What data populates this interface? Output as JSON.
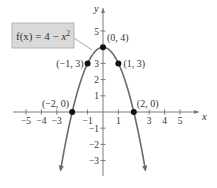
{
  "chart_data": {
    "type": "line",
    "title": "",
    "function_label": "f(x) = 4 − x²",
    "xlabel": "x",
    "ylabel": "y",
    "xlim": [
      -5.5,
      5.8
    ],
    "ylim": [
      -4.3,
      5.8
    ],
    "x_ticks": [
      -5,
      -4,
      -3,
      -1,
      1,
      3,
      4,
      5
    ],
    "x_tick_labels": [
      "−5",
      "−4",
      "−3",
      "−1",
      "1",
      "3",
      "4",
      "5"
    ],
    "y_ticks": [
      5,
      3,
      2,
      1,
      -1,
      -2,
      -3
    ],
    "y_tick_labels": [
      "5",
      "3",
      "2",
      "1",
      "−1",
      "−2",
      "−3"
    ],
    "grid": false,
    "series": [
      {
        "name": "f(x) = 4 − x²",
        "color": "#6b6b6b",
        "x_range": [
          -2.75,
          2.75
        ],
        "end_arrows": true
      }
    ],
    "points": [
      {
        "x": -2,
        "y": 0,
        "label": "(−2, 0)"
      },
      {
        "x": -1,
        "y": 3,
        "label": "(−1, 3)"
      },
      {
        "x": 0,
        "y": 4,
        "label": "(0, 4)"
      },
      {
        "x": 1,
        "y": 3,
        "label": "(1, 3)"
      },
      {
        "x": 2,
        "y": 0,
        "label": "(2, 0)"
      }
    ],
    "colors": {
      "curve": "#6b6b6b",
      "axes": "#7a7a7a",
      "points": "#111111",
      "label_box_fill": "#d9d9d9",
      "label_box_stroke": "#a8a8a8"
    }
  }
}
